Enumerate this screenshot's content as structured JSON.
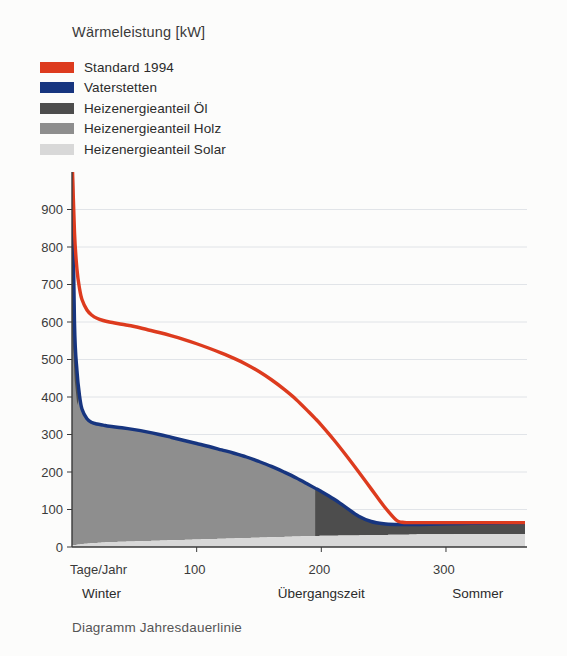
{
  "axis_title": "Wärmeleistung [kW]",
  "caption": "Diagramm Jahresdauerlinie",
  "legend": {
    "items": [
      {
        "label": "Standard 1994",
        "color": "#dd3b1e",
        "swatch": "solid"
      },
      {
        "label": "Vaterstetten",
        "color": "#17357f",
        "swatch": "solid"
      },
      {
        "label": "Heizenergieanteil Öl",
        "color": "#4d4d4d",
        "swatch": "solid"
      },
      {
        "label": "Heizenergieanteil Holz",
        "color": "#8e8e8e",
        "swatch": "solid"
      },
      {
        "label": "Heizenergieanteil Solar",
        "color": "#d8d8d8",
        "swatch": "solid"
      }
    ]
  },
  "chart_data": {
    "type": "area",
    "title": "Wärmeleistung [kW]",
    "xlabel": "Tage/Jahr",
    "ylabel": "Wärmeleistung [kW]",
    "xlim": [
      0,
      365
    ],
    "ylim": [
      0,
      1000
    ],
    "grid": true,
    "legend_position": "top-left",
    "ytick_labels": [
      "0",
      "100",
      "200",
      "300",
      "400",
      "500",
      "600",
      "700",
      "800",
      "900"
    ],
    "ytick_values": [
      0,
      100,
      200,
      300,
      400,
      500,
      600,
      700,
      800,
      900
    ],
    "xtick_labels": [
      "Tage/Jahr",
      "100",
      "200",
      "300"
    ],
    "xtick_values": [
      0,
      100,
      200,
      300
    ],
    "season_labels": [
      {
        "text": "Winter",
        "x": 8
      },
      {
        "text": "Übergangszeit",
        "x": 165
      },
      {
        "text": "Sommer",
        "x": 305
      }
    ],
    "x": [
      0,
      2,
      4,
      6,
      8,
      12,
      16,
      20,
      25,
      30,
      40,
      50,
      60,
      70,
      80,
      90,
      100,
      110,
      120,
      130,
      140,
      150,
      160,
      170,
      180,
      190,
      195,
      200,
      210,
      220,
      230,
      240,
      250,
      260,
      265,
      270,
      280,
      300,
      320,
      340,
      365
    ],
    "series": [
      {
        "name": "Standard 1994",
        "color": "#dd3b1e",
        "type": "line",
        "values": [
          1050,
          840,
          740,
          690,
          660,
          632,
          618,
          610,
          604,
          600,
          594,
          588,
          580,
          572,
          563,
          553,
          542,
          530,
          517,
          503,
          487,
          468,
          446,
          421,
          393,
          360,
          343,
          325,
          286,
          244,
          200,
          155,
          110,
          72,
          66,
          65,
          65,
          65,
          65,
          65,
          65
        ]
      },
      {
        "name": "Vaterstetten",
        "color": "#17357f",
        "type": "line",
        "values": [
          1050,
          600,
          470,
          405,
          368,
          342,
          332,
          328,
          325,
          322,
          318,
          313,
          307,
          300,
          292,
          284,
          276,
          268,
          259,
          250,
          240,
          228,
          215,
          200,
          184,
          166,
          157,
          148,
          128,
          105,
          82,
          68,
          62,
          60,
          60,
          60,
          60,
          62,
          63,
          64,
          65
        ]
      },
      {
        "name": "Heizenergieanteil Öl",
        "color": "#4d4d4d",
        "type": "area",
        "note": "Dark band hugging the Vaterstetten curve at the extreme left (above ~500 kW) and the full band from day 195 to 365 below the Vaterstetten curve."
      },
      {
        "name": "Heizenergieanteil Holz",
        "color": "#8e8e8e",
        "type": "area",
        "note": "Fills under the Vaterstetten curve from day 0 to day 195, above the Solar band; cut off by a vertical edge at day 195."
      },
      {
        "name": "Heizenergieanteil Solar",
        "color": "#d8d8d8",
        "type": "area",
        "values_at_baseline": [
          5,
          5,
          6,
          7,
          8,
          9,
          10,
          11,
          12,
          13,
          14,
          15,
          16,
          17,
          18,
          19,
          20,
          21,
          22,
          23,
          24,
          25,
          26,
          27,
          28,
          29,
          29,
          30,
          30,
          31,
          31,
          32,
          32,
          33,
          33,
          33,
          34,
          34,
          35,
          35,
          35
        ],
        "note": "Light band along the x-axis rising from ~5 kW to ~35 kW."
      }
    ]
  }
}
